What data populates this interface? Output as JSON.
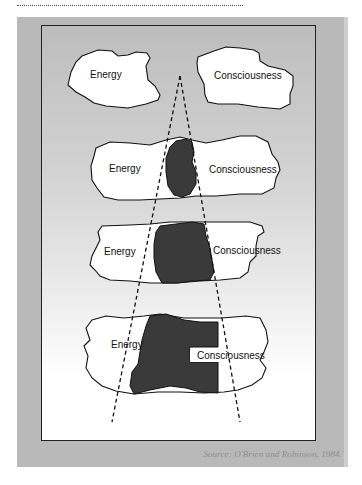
{
  "diagram": {
    "title": "",
    "rows": [
      {
        "id": "row-1",
        "left_label": "Energy",
        "right_label": "Consciousness",
        "overlap": "none"
      },
      {
        "id": "row-2",
        "left_label": "Energy",
        "right_label": "Consciousness",
        "overlap": "small"
      },
      {
        "id": "row-3",
        "left_label": "Energy",
        "right_label": "Consciousness",
        "overlap": "medium"
      },
      {
        "id": "row-4",
        "left_label": "Energy",
        "right_label": "Consciousness",
        "overlap": "large"
      }
    ],
    "colors": {
      "frame": "#b9b9b9",
      "blob_fill": "#ffffff",
      "overlap_fill": "#3a3a3a",
      "outline": "#111111",
      "dashed": "#111111"
    }
  },
  "caption": "Source: O'Brien and Robinson, 1984."
}
